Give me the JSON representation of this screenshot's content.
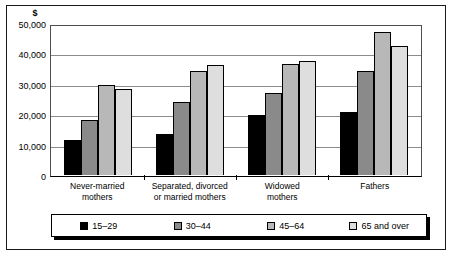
{
  "chart_data": {
    "type": "bar",
    "title": "",
    "subtitle": "",
    "xlabel": "",
    "ylabel": "$",
    "ylim": [
      0,
      50000
    ],
    "yticks": [
      0,
      10000,
      20000,
      30000,
      40000,
      50000
    ],
    "ytick_labels": [
      "0",
      "10,000",
      "20,000",
      "30,000",
      "40,000",
      "50,000"
    ],
    "grid": true,
    "legend_position": "bottom",
    "categories": [
      "Never-married\nmothers",
      "Separated, divorced\nor married mothers",
      "Widowed\nmothers",
      "Fathers"
    ],
    "series": [
      {
        "name": "15–29",
        "color": "#000000",
        "values": [
          11500,
          13800,
          20000,
          21000
        ]
      },
      {
        "name": "30–44",
        "color": "#8a8a8a",
        "values": [
          18200,
          24400,
          27200,
          34800
        ]
      },
      {
        "name": "45–64",
        "color": "#b8b8b8",
        "values": [
          30000,
          34800,
          37000,
          47800
        ]
      },
      {
        "name": "65 and over",
        "color": "#dedede",
        "values": [
          28700,
          36700,
          38000,
          43000
        ]
      }
    ]
  }
}
